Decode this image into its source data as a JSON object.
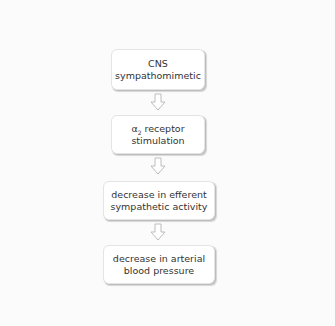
{
  "diagram": {
    "type": "flowchart",
    "direction": "top-to-bottom",
    "nodes": [
      {
        "id": "n1",
        "lines": [
          "CNS",
          "sympathomimetic"
        ]
      },
      {
        "id": "n2",
        "lines": [
          "α₂ receptor",
          "stimulation"
        ],
        "symbol": "α",
        "subscript": "2",
        "rest": " receptor"
      },
      {
        "id": "n3",
        "lines": [
          "decrease in efferent",
          "sympathetic activity"
        ]
      },
      {
        "id": "n4",
        "lines": [
          "decrease in arterial",
          "blood pressure"
        ]
      }
    ],
    "edges": [
      {
        "from": "n1",
        "to": "n2",
        "style": "hollow-down-arrow"
      },
      {
        "from": "n2",
        "to": "n3",
        "style": "hollow-down-arrow"
      },
      {
        "from": "n3",
        "to": "n4",
        "style": "hollow-down-arrow"
      }
    ],
    "colors": {
      "background": "#fbfbfb",
      "box_fill": "#ffffff",
      "box_border": "#e4e4e4",
      "box_shadow": "#bdbdbd",
      "arrow_stroke": "#bcbcbc",
      "text": "#333333"
    }
  }
}
